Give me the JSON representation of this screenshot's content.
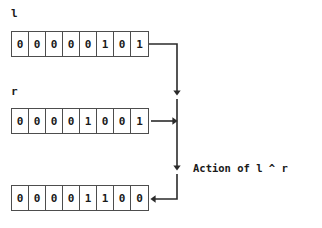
{
  "diagram": {
    "caption": "Action of l ^ r",
    "operator_symbol": "^",
    "stroke_color": "#2b2b2b",
    "box_border_color": "#4d4d4d",
    "text_color": "#1a1a1a",
    "background_color": "#ffffff",
    "operands": [
      {
        "label": "l",
        "bits": [
          "0",
          "0",
          "0",
          "0",
          "0",
          "1",
          "0",
          "1"
        ]
      },
      {
        "label": "r",
        "bits": [
          "0",
          "0",
          "0",
          "0",
          "1",
          "0",
          "0",
          "1"
        ]
      }
    ],
    "result": {
      "label": "",
      "bits": [
        "0",
        "0",
        "0",
        "0",
        "1",
        "1",
        "0",
        "0"
      ]
    }
  }
}
